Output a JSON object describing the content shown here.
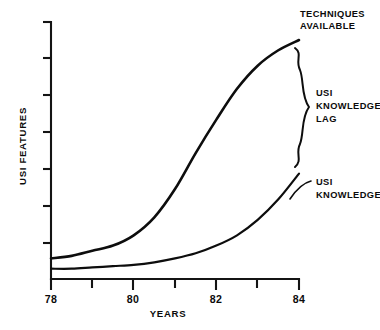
{
  "chart_data": {
    "type": "area",
    "title": "",
    "xlabel": "YEARS",
    "ylabel": "USI FEATURES",
    "xlim": [
      78,
      84
    ],
    "ylim": [
      0,
      100
    ],
    "grid": false,
    "legend_position": "inline-right-annotations",
    "x_tick_values": [
      78,
      79,
      80,
      81,
      82,
      83,
      84
    ],
    "x_tick_labels": [
      "78",
      "",
      "80",
      "",
      "82",
      "",
      "84"
    ],
    "y_tick_count": 7,
    "y_tick_labels": [
      "",
      "",
      "",
      "",
      "",
      "",
      ""
    ],
    "x": [
      78,
      78.5,
      79,
      79.5,
      80,
      80.5,
      81,
      81.5,
      82,
      82.5,
      83,
      83.5,
      84
    ],
    "series": [
      {
        "name": "TECHNIQUES AVAILABLE",
        "values": [
          8,
          9,
          11,
          13,
          17,
          24,
          35,
          49,
          62,
          74,
          83,
          89,
          93
        ]
      },
      {
        "name": "USI KNOWLEDGE",
        "values": [
          4,
          4,
          4.5,
          5,
          5.5,
          6.5,
          8,
          10,
          13,
          17,
          23,
          31,
          41
        ]
      }
    ],
    "fill_between": {
      "label": "USI KNOWLEDGE LAG",
      "pattern": "diagonal-hatch",
      "between": [
        "TECHNIQUES AVAILABLE",
        "USI KNOWLEDGE"
      ]
    },
    "annotations": [
      {
        "id": "techniques-available",
        "text": "TECHNIQUES AVAILABLE",
        "lines": [
          "TECHNIQUES",
          "AVAILABLE"
        ],
        "points_to": "upper curve right end"
      },
      {
        "id": "usi-knowledge-lag",
        "text": "USI KNOWLEDGE LAG",
        "lines": [
          "USI",
          "KNOWLEDGE",
          "LAG"
        ],
        "points_to": "hatched gap at year 84"
      },
      {
        "id": "usi-knowledge",
        "text": "USI KNOWLEDGE",
        "lines": [
          "USI",
          "KNOWLEDGE"
        ],
        "points_to": "lower curve right end"
      }
    ],
    "colors": {
      "ink": "#0d0d0d",
      "hatch": "#202020",
      "background": "#ffffff"
    }
  },
  "axes": {
    "x_title": "YEARS",
    "y_title": "USI FEATURES",
    "x_labels": [
      {
        "value": "78",
        "x": 78
      },
      {
        "value": "80",
        "x": 80
      },
      {
        "value": "82",
        "x": 82
      },
      {
        "value": "84",
        "x": 84
      }
    ]
  },
  "annotations": {
    "techniques": {
      "line1": "TECHNIQUES",
      "line2": "AVAILABLE"
    },
    "lag": {
      "line1": "USI",
      "line2": "KNOWLEDGE",
      "line3": "LAG"
    },
    "knowledge": {
      "line1": "USI",
      "line2": "KNOWLEDGE"
    }
  }
}
